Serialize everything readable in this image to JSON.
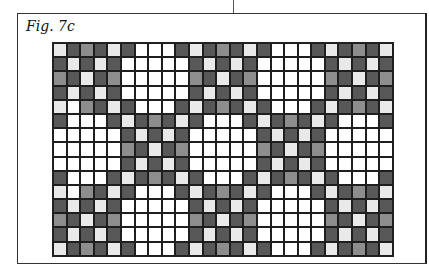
{
  "figure": {
    "label": "Fig. 7c"
  },
  "pattern": {
    "rows": 15,
    "cols": 25,
    "legend": {
      "W": {
        "name": "white",
        "color": "#ffffff"
      },
      "L": {
        "name": "light-grey",
        "color": "#e9e9e9"
      },
      "M": {
        "name": "mid-grey",
        "color": "#8d8d8d"
      },
      "D": {
        "name": "dark-grey",
        "color": "#585858"
      }
    },
    "grid": [
      "LDMDLDWWWDLDMDLDWWWDLDMDL",
      "DLDLDWWWWWDLDLDWWWWWDLDLD",
      "MDLDMWWWWWMDLDMWWWWWMDLDM",
      "DLDLDWWWWWDLDLDWWWWWDLDLD",
      "LWMDLDWWWDLDMDLDWWWDLDMDL",
      "DWWWDLDMDLDWWWDLDMDLDWWWD",
      "WWWWWDLDLDWWWWWDLDLDWWWWW",
      "WWWWWMDLDMWWWWWMDLDMWWWWW",
      "WWWWWDLDLDWWWWWDLDLDWWWWW",
      "DWWWDLDMDLDWWWDLDMDLDWWWD",
      "LWMDLDWWWDLDMDLDWWWDLDMDL",
      "DLDLDWWWWWDLDLDWWWWWDLDLD",
      "MDLDMWWWWWMDLDMWWWWWMDLDM",
      "DLDLDWWWWWDLDLDWWWWWDLDLD",
      "LDMDLDWWWDLDMDLDWWWDLDMDL"
    ]
  }
}
